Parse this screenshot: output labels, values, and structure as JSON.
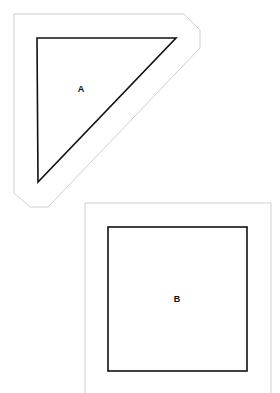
{
  "diagram": {
    "shapes": [
      {
        "id": "A",
        "label": "A",
        "kind": "right-triangle",
        "outline_color": "#111111",
        "offset_border_color": "#cccccc"
      },
      {
        "id": "B",
        "label": "B",
        "kind": "square",
        "outline_color": "#111111",
        "offset_border_color": "#cccccc"
      }
    ]
  }
}
